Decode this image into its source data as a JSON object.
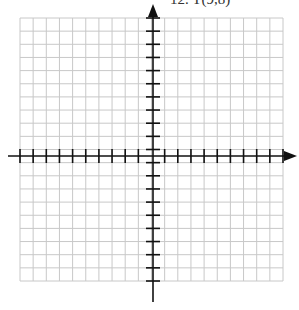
{
  "problem": {
    "label": "12. T(9,8)"
  },
  "grid": {
    "left": 20,
    "top": 18,
    "cell": 13.15,
    "cols": 20,
    "rows": 20,
    "line_color": "#c8c8c8",
    "axis_color": "#111111"
  },
  "axes": {
    "x_axis_y": 156,
    "y_axis_x": 153,
    "x_arrow_tip": 297,
    "y_arrow_tip": 4,
    "x_start": 8,
    "y_end": 302
  }
}
